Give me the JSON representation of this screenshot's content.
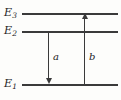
{
  "diagram": {
    "type": "energy-level-diagram",
    "background_color": "#fdfdfb",
    "line_color": "#3a3a3a",
    "text_color": "#1c1c1c",
    "levels": [
      {
        "id": "E3",
        "symbol": "E",
        "subscript": "3",
        "label": "E3",
        "y": 13,
        "x_start": 22,
        "x_end": 118,
        "label_x": 4,
        "label_y": 7
      },
      {
        "id": "E2",
        "symbol": "E",
        "subscript": "2",
        "label": "E2",
        "y": 31,
        "x_start": 22,
        "x_end": 118,
        "label_x": 4,
        "label_y": 25
      },
      {
        "id": "E1",
        "symbol": "E",
        "subscript": "1",
        "label": "E1",
        "y": 84,
        "x_start": 22,
        "x_end": 118,
        "label_x": 4,
        "label_y": 78
      }
    ],
    "transitions": [
      {
        "id": "a",
        "label": "a",
        "direction": "down",
        "from_level": "E2",
        "from_y": 31,
        "to_level": "E1",
        "to_y": 84,
        "x": 48,
        "label_x": 53,
        "label_y": 52
      },
      {
        "id": "b",
        "label": "b",
        "direction": "up",
        "from_level": "E1",
        "from_y": 84,
        "to_level": "E3",
        "to_y": 13,
        "x": 84,
        "label_x": 89,
        "label_y": 52
      }
    ]
  }
}
